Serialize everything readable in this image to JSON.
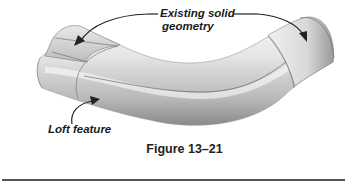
{
  "figure": {
    "callouts": {
      "top": {
        "line1": "Existing solid",
        "line2": "geometry"
      },
      "left": {
        "text": "Loft feature"
      }
    },
    "caption": "Figure 13–21"
  },
  "colors": {
    "background": "#ffffff",
    "text": "#1a1a1a",
    "tube_light": "#f2f2f2",
    "tube_mid": "#c8c8c8",
    "tube_dark": "#8f8f8f",
    "edge_lines": "#555555",
    "divider": "#555555"
  }
}
